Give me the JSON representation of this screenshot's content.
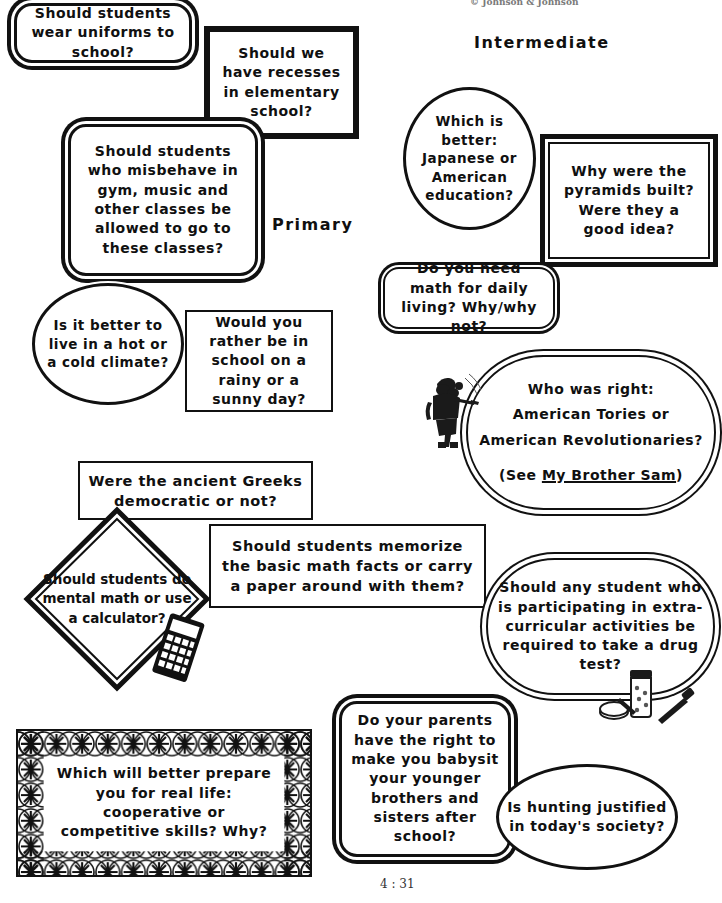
{
  "page": {
    "header": "© Johnson & Johnson",
    "footer": "4 : 31"
  },
  "labels": {
    "primary": "Primary",
    "intermediate": "Intermediate"
  },
  "questions": {
    "uniforms": {
      "text": "Should students wear uniforms to school?",
      "shape": "rounded-rectangle"
    },
    "recesses": {
      "text": "Should we have recesses in elementary school?",
      "shape": "heavy-rectangle"
    },
    "misbehave": {
      "text": "Should students who misbehave in gym, music and other classes be allowed to go to these classes?",
      "shape": "rounded-rectangle"
    },
    "climate": {
      "text": "Is it better to live in a hot or a cold climate?",
      "shape": "scalloped-circle"
    },
    "rainy": {
      "text": "Would you rather be in school on a rainy or a sunny day?",
      "shape": "thin-rectangle"
    },
    "japanese": {
      "text": "Which is better: Japanese or American education?",
      "shape": "scalloped-circle"
    },
    "pyramids": {
      "text": "Why were the pyramids built? Were they a good idea?",
      "shape": "double-rectangle"
    },
    "dailymath": {
      "text": "Do you need math for daily living? Why/why not?",
      "shape": "rounded-rectangle"
    },
    "tories": {
      "line1": "Who was right:",
      "line2": "American Tories or",
      "line3": "American Revolutionaries?",
      "line4_pre": "(See ",
      "line4_em": "My Brother Sam",
      "line4_post": ")",
      "shape": "pill"
    },
    "greeks": {
      "text": "Were the ancient Greeks democratic or not?",
      "shape": "thin-rectangle"
    },
    "mentalmath": {
      "text": "Should students do mental math or use a calculator?",
      "shape": "diamond"
    },
    "memorize": {
      "text": "Should students memorize the basic math facts or carry a paper around with them?",
      "shape": "thin-rectangle"
    },
    "drugtest": {
      "text": "Should any student who is participating in extra-curricular activities be required to take a drug test?",
      "shape": "pill"
    },
    "babysit": {
      "text": "Do your parents have the right to make you babysit your younger brothers and sisters after school?",
      "shape": "rounded-rectangle"
    },
    "hunting": {
      "text": "Is hunting justified in today's society?",
      "shape": "ellipse"
    },
    "cooperative": {
      "text": "Which will better prepare you for real life: cooperative or competitive skills? Why?",
      "shape": "braided-rectangle"
    }
  },
  "clipart": {
    "soldiers": "colonial-soldiers-clipart",
    "calculator": "calculator-clipart",
    "drugs": "pills-and-syringe-clipart"
  }
}
